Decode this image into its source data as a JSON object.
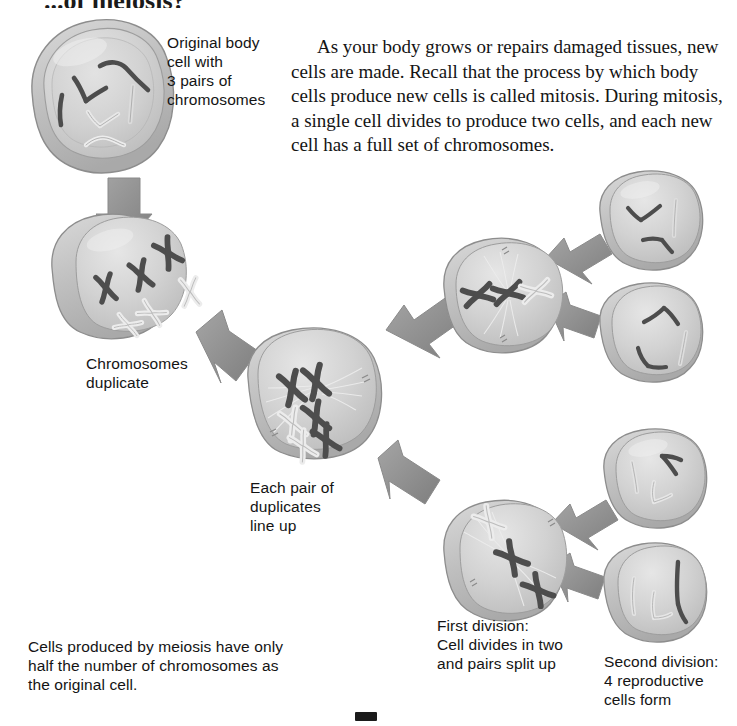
{
  "page": {
    "title_partial": "...of meiosis?",
    "background_color": "#ffffff",
    "text_color": "#141414"
  },
  "body_text": {
    "paragraph": "As your body grows or repairs damaged tissues, new cells are made. Recall that the process by which body cells produce new cells is called mitosis. During mitosis, a single cell divides to produce two cells, and each new cell has a full set of chromosomes."
  },
  "labels": {
    "original_cell": "Original body\ncell with\n3 pairs of\nchromosomes",
    "chromosomes_duplicate": "Chromosomes\nduplicate",
    "pairs_line_up": "Each pair of\nduplicates\nline up",
    "first_division": "First division:\nCell divides in two\nand pairs split up",
    "second_division": "Second division:\n4 reproductive\ncells form",
    "meiosis_caption": "Cells produced by meiosis have only\nhalf the number of chromosomes as\nthe original cell."
  },
  "diagram": {
    "type": "biology-process-diagram",
    "process": "meiosis",
    "cells": [
      {
        "id": "original-body-cell",
        "stage": "interphase",
        "chromosome_count": 6,
        "chromosome_form": "single-strand",
        "description": "Original body cell with 3 pairs of chromosomes"
      },
      {
        "id": "duplicated-cell",
        "stage": "after-duplication",
        "chromosome_count": 6,
        "chromosome_form": "duplicated-X",
        "description": "Chromosomes duplicate"
      },
      {
        "id": "aligned-cell",
        "stage": "metaphase-I",
        "chromosome_count": 6,
        "chromosome_form": "duplicated-X-paired",
        "description": "Each pair of duplicates line up"
      },
      {
        "id": "first-division-upper",
        "stage": "metaphase-II",
        "chromosome_count": 3,
        "chromosome_form": "duplicated-X",
        "description": "Daughter cell after first division"
      },
      {
        "id": "first-division-lower",
        "stage": "metaphase-II",
        "chromosome_count": 3,
        "chromosome_form": "duplicated-X",
        "description": "Daughter cell after first division"
      },
      {
        "id": "reproductive-cell-1",
        "stage": "final",
        "chromosome_count": 3,
        "chromosome_form": "single-strand",
        "description": "Reproductive cell"
      },
      {
        "id": "reproductive-cell-2",
        "stage": "final",
        "chromosome_count": 3,
        "chromosome_form": "single-strand",
        "description": "Reproductive cell"
      },
      {
        "id": "reproductive-cell-3",
        "stage": "final",
        "chromosome_count": 3,
        "chromosome_form": "single-strand",
        "description": "Reproductive cell"
      },
      {
        "id": "reproductive-cell-4",
        "stage": "final",
        "chromosome_count": 3,
        "chromosome_form": "single-strand",
        "description": "Reproductive cell"
      }
    ],
    "arrows": [
      {
        "id": "arrow-1",
        "from": "original-body-cell",
        "to": "duplicated-cell"
      },
      {
        "id": "arrow-2",
        "from": "duplicated-cell",
        "to": "aligned-cell"
      },
      {
        "id": "arrow-3",
        "from": "aligned-cell",
        "to": "first-division-upper"
      },
      {
        "id": "arrow-4",
        "from": "aligned-cell",
        "to": "first-division-lower"
      },
      {
        "id": "arrow-5",
        "from": "first-division-upper",
        "to": "reproductive-cell-1"
      },
      {
        "id": "arrow-6",
        "from": "first-division-upper",
        "to": "reproductive-cell-2"
      },
      {
        "id": "arrow-7",
        "from": "first-division-lower",
        "to": "reproductive-cell-3"
      },
      {
        "id": "arrow-8",
        "from": "first-division-lower",
        "to": "reproductive-cell-4"
      }
    ],
    "colors": {
      "cell_fill": "#cfcfcf",
      "cell_fill_light": "#dedede",
      "cell_rim": "#b0b0b0",
      "cell_outline": "#8d8d8d",
      "arrow_fill": "#8f8f8f",
      "chromosome_dark": "#4a4a4a",
      "chromosome_light": "#e3e3e3",
      "spindle": "#e8e8e8"
    }
  }
}
